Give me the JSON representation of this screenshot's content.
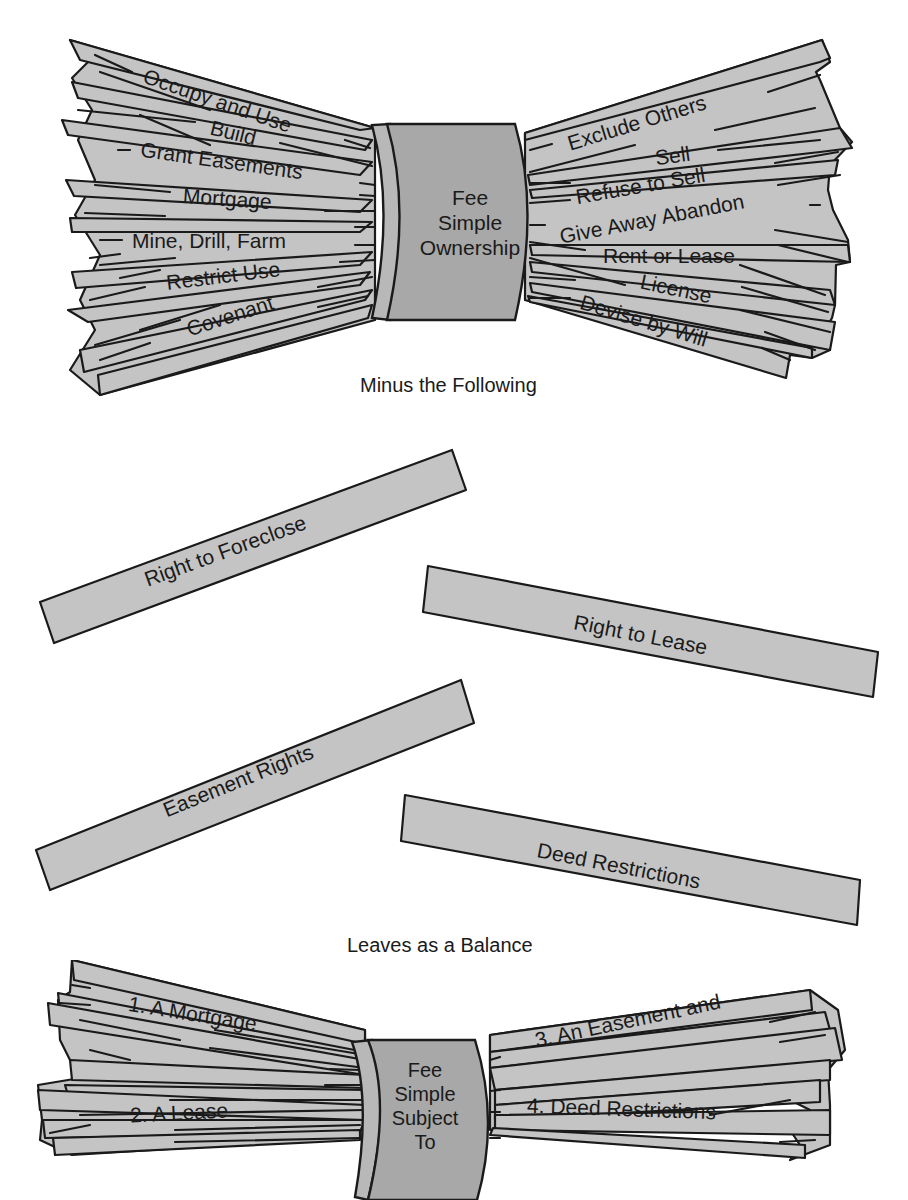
{
  "top_bundle": {
    "center_label": [
      "Fee",
      "Simple",
      "Ownership"
    ],
    "left_rights": [
      "Occupy and Use",
      "Build",
      "Grant Easements",
      "Mortgage",
      "Mine, Drill, Farm",
      "Restrict Use",
      "Covenant"
    ],
    "right_rights": [
      "Exclude Others",
      "Sell",
      "Refuse to Sell",
      "Give Away Abandon",
      "Rent or Lease",
      "License",
      "Devise by Will"
    ]
  },
  "caption_minus": "Minus the Following",
  "removed_sticks": [
    {
      "label": "Right to Foreclose"
    },
    {
      "label": "Right to Lease"
    },
    {
      "label": "Easement Rights"
    },
    {
      "label": "Deed Restrictions"
    }
  ],
  "caption_balance": "Leaves as a Balance",
  "bottom_bundle": {
    "center_label": [
      "Fee",
      "Simple",
      "Subject",
      "To"
    ],
    "left_items": [
      "1. A Mortgage",
      "2. A Lease"
    ],
    "right_items": [
      "3. An Easement and",
      "4. Deed Restrictions"
    ]
  },
  "colors": {
    "stick_fill": "#c4c4c4",
    "band_fill": "#a8a8a8",
    "outline": "#1a1a1a",
    "background": "#ffffff"
  }
}
